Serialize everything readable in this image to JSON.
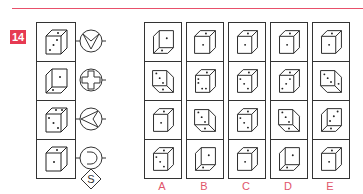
{
  "question": {
    "number": "14",
    "accent_color": "#e63a52",
    "label_color": "#e0556b"
  },
  "key": {
    "rows": [
      {
        "die_faces": {
          "front": 3,
          "top": 1,
          "side": 1
        },
        "symbol": "circle-v-icon"
      },
      {
        "die_faces": {
          "front": 1,
          "top": 1,
          "side": 0
        },
        "symbol": "circle-cross-icon"
      },
      {
        "die_faces": {
          "front": 4,
          "top": 2,
          "side": 0
        },
        "symbol": "circle-arrow-left-icon"
      },
      {
        "die_faces": {
          "front": 1,
          "top": 1,
          "side": 0
        },
        "symbol": "circle-c-icon"
      }
    ],
    "extra_symbol": {
      "name": "diamond-s-icon",
      "letter": "S"
    }
  },
  "options": [
    {
      "label": "A"
    },
    {
      "label": "B"
    },
    {
      "label": "C"
    },
    {
      "label": "D"
    },
    {
      "label": "E"
    }
  ]
}
